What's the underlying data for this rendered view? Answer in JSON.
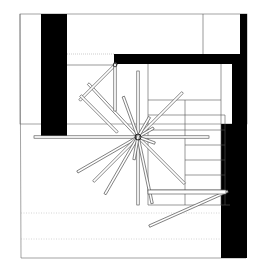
{
  "drawing": {
    "type": "architectural-plan",
    "description": "Plan view of a stair/room with radiating rotating rods around a central pivot",
    "colors": {
      "wall": "#000000",
      "line": "#555555",
      "background": "#ffffff",
      "dotted": "#999999"
    },
    "frame": {
      "x": 20,
      "y": 14,
      "w": 227,
      "h": 244
    },
    "pivot": {
      "x": 138,
      "y": 137
    }
  }
}
